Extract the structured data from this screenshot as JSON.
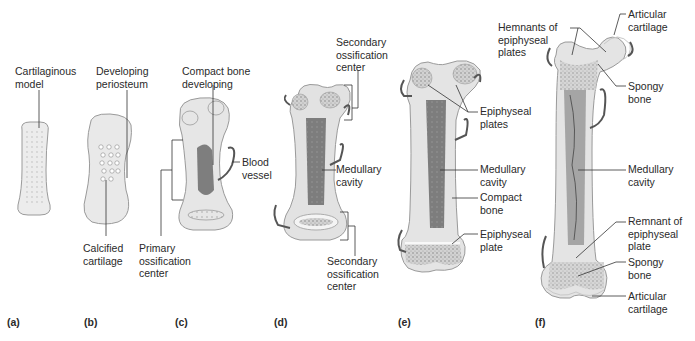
{
  "diagram": {
    "type": "bone development (endochondral ossification) stages",
    "panels": [
      {
        "id": "a",
        "label": "(a)",
        "annotations": [
          "Cartilaginous\nmodel"
        ]
      },
      {
        "id": "b",
        "label": "(b)",
        "annotations": [
          "Developing\nperiosteum",
          "Calcified\ncartilage"
        ]
      },
      {
        "id": "c",
        "label": "(c)",
        "annotations": [
          "Compact bone\ndeveloping",
          "Blood\nvessel",
          "Primary\nossification\ncenter"
        ]
      },
      {
        "id": "d",
        "label": "(d)",
        "annotations": [
          "Secondary\nossification\ncenter",
          "Medullary\ncavity",
          "Secondary\nossification\ncenter"
        ]
      },
      {
        "id": "e",
        "label": "(e)",
        "annotations": [
          "Epiphyseal\nplates",
          "Medullary\ncavity",
          "Compact\nbone",
          "Epiphyseal\nplate"
        ]
      },
      {
        "id": "f",
        "label": "(f)",
        "annotations": [
          "Hemnants of\nepiphyseal\nplates",
          "Articular\ncartilage",
          "Spongy\nbone",
          "Medullary\ncavity",
          "Remnant of\nepiphyseal\nplate",
          "Spongy\nbone",
          "Articular\ncartilage"
        ]
      }
    ]
  },
  "labels": {
    "a_cartilaginous_model": "Cartilaginous\nmodel",
    "b_developing_periosteum": "Developing\nperiosteum",
    "b_calcified_cartilage": "Calcified\ncartilage",
    "c_compact_bone_developing": "Compact bone\ndeveloping",
    "c_blood_vessel": "Blood\nvessel",
    "c_primary_ossification_center": "Primary\nossification\ncenter",
    "d_secondary_ossification_center_top": "Secondary\nossification\ncenter",
    "d_medullary_cavity": "Medullary\ncavity",
    "d_secondary_ossification_center_bottom": "Secondary\nossification\ncenter",
    "e_epiphyseal_plates": "Epiphyseal\nplates",
    "e_medullary_cavity": "Medullary\ncavity",
    "e_compact_bone": "Compact\nbone",
    "e_epiphyseal_plate": "Epiphyseal\nplate",
    "f_hemnants_of_epiphyseal_plates": "Hemnants of\nepiphyseal\nplates",
    "f_articular_cartilage_top": "Articular\ncartilage",
    "f_spongy_bone_top": "Spongy\nbone",
    "f_medullary_cavity": "Medullary\ncavity",
    "f_remnant_of_epiphyseal_plate": "Remnant of\nepiphyseal\nplate",
    "f_spongy_bone_bottom": "Spongy\nbone",
    "f_articular_cartilage_bottom": "Articular\ncartilage"
  },
  "panel_labels": {
    "a": "(a)",
    "b": "(b)",
    "c": "(c)",
    "d": "(d)",
    "e": "(e)",
    "f": "(f)"
  },
  "colors": {
    "cartilage": "#ececec",
    "cartilage_edge": "#9a9a9a",
    "cortex": "#dcdcdc",
    "marrow": "#6b6b6b",
    "vessel": "#555555",
    "leader": "#333333"
  }
}
